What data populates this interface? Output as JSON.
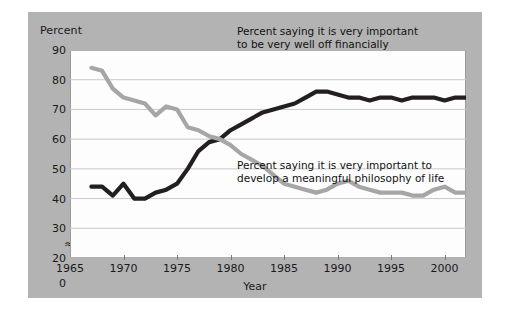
{
  "figure": {
    "background_color": "#b3b3b3",
    "plot_background_color": "#fdfdfd",
    "axis_break_glyph": "≈"
  },
  "chart_data": {
    "type": "line",
    "title": "",
    "xlabel": "Year",
    "ylabel": "Percent",
    "xlim": [
      1965,
      2002
    ],
    "ylim": [
      20,
      90
    ],
    "grid": true,
    "grid_axis": "y",
    "legend_position": "inline-annotations",
    "y_axis_break": true,
    "ytick_labels": [
      "90",
      "80",
      "70",
      "60",
      "50",
      "40",
      "30",
      "20",
      "0"
    ],
    "yticks": [
      90,
      80,
      70,
      60,
      50,
      40,
      30,
      20,
      0
    ],
    "xtick_labels": [
      "1965",
      "1970",
      "1975",
      "1980",
      "1985",
      "1990",
      "1995",
      "2000"
    ],
    "xticks": [
      1965,
      1970,
      1975,
      1980,
      1985,
      1990,
      1995,
      2000
    ],
    "series": [
      {
        "name": "Percent saying it is very important to be very well off financially",
        "color": "#231f20",
        "annotation": "Percent saying it is very important\nto be very well off financially",
        "x": [
          1967,
          1968,
          1969,
          1970,
          1971,
          1972,
          1973,
          1974,
          1975,
          1976,
          1977,
          1978,
          1979,
          1980,
          1981,
          1982,
          1983,
          1984,
          1985,
          1986,
          1987,
          1988,
          1989,
          1990,
          1991,
          1992,
          1993,
          1994,
          1995,
          1996,
          1997,
          1998,
          1999,
          2000,
          2001,
          2002
        ],
        "values": [
          44,
          44,
          41,
          45,
          40,
          40,
          42,
          43,
          45,
          50,
          56,
          59,
          60,
          63,
          65,
          67,
          69,
          70,
          71,
          72,
          74,
          76,
          76,
          75,
          74,
          74,
          73,
          74,
          74,
          73,
          74,
          74,
          74,
          73,
          74,
          74
        ]
      },
      {
        "name": "Percent saying it is very important to develop a meaningful philosophy of life",
        "color": "#a6a6a6",
        "annotation": "Percent saying it is very important to\ndevelop a meaningful philosophy of life",
        "x": [
          1967,
          1968,
          1969,
          1970,
          1971,
          1972,
          1973,
          1974,
          1975,
          1976,
          1977,
          1978,
          1979,
          1980,
          1981,
          1982,
          1983,
          1984,
          1985,
          1986,
          1987,
          1988,
          1989,
          1990,
          1991,
          1992,
          1993,
          1994,
          1995,
          1996,
          1997,
          1998,
          1999,
          2000,
          2001,
          2002
        ],
        "values": [
          84,
          83,
          77,
          74,
          73,
          72,
          68,
          71,
          70,
          64,
          63,
          61,
          60,
          58,
          55,
          53,
          51,
          48,
          45,
          44,
          43,
          42,
          43,
          45,
          46,
          44,
          43,
          42,
          42,
          42,
          41,
          41,
          43,
          44,
          42,
          42
        ]
      }
    ]
  }
}
